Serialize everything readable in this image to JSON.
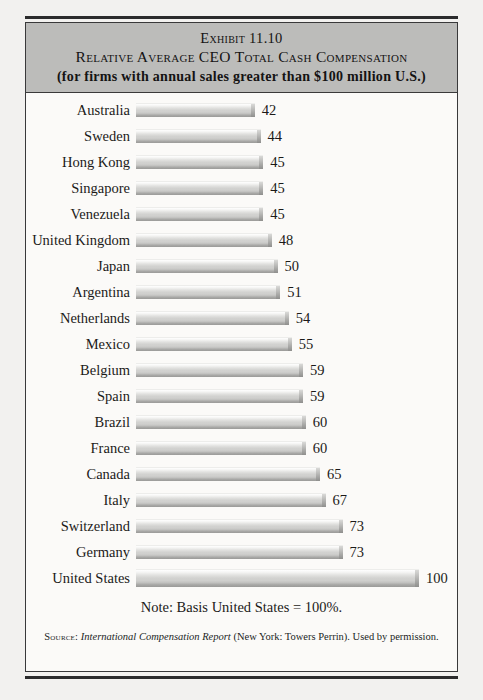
{
  "exhibit": {
    "number": "Exhibit 11.10",
    "title": "Relative Average CEO Total Cash Compensation",
    "subtitle": "(for firms with annual sales greater than $100 million U.S.)",
    "note": "Note: Basis United States = 100%.",
    "source_label": "Source:",
    "source_report": "International Compensation Report",
    "source_rest": "(New York: Towers Perrin). Used by permission."
  },
  "chart_data": {
    "type": "bar",
    "orientation": "horizontal",
    "title": "Relative Average CEO Total Cash Compensation",
    "subtitle": "(for firms with annual sales greater than $100 million U.S.)",
    "xlabel": "",
    "ylabel": "",
    "xlim": [
      0,
      100
    ],
    "grid": false,
    "legend": false,
    "value_unit": "index (United States = 100)",
    "categories": [
      "Australia",
      "Sweden",
      "Hong Kong",
      "Singapore",
      "Venezuela",
      "United Kingdom",
      "Japan",
      "Argentina",
      "Netherlands",
      "Mexico",
      "Belgium",
      "Spain",
      "Brazil",
      "France",
      "Canada",
      "Italy",
      "Switzerland",
      "Germany",
      "United States"
    ],
    "values": [
      42,
      44,
      45,
      45,
      45,
      48,
      50,
      51,
      54,
      55,
      59,
      59,
      60,
      60,
      65,
      67,
      73,
      73,
      100
    ],
    "bars": [
      {
        "label": "Australia",
        "value": 42,
        "value_text": "42"
      },
      {
        "label": "Sweden",
        "value": 44,
        "value_text": "44"
      },
      {
        "label": "Hong Kong",
        "value": 45,
        "value_text": "45"
      },
      {
        "label": "Singapore",
        "value": 45,
        "value_text": "45"
      },
      {
        "label": "Venezuela",
        "value": 45,
        "value_text": "45"
      },
      {
        "label": "United Kingdom",
        "value": 48,
        "value_text": "48"
      },
      {
        "label": "Japan",
        "value": 50,
        "value_text": "50"
      },
      {
        "label": "Argentina",
        "value": 51,
        "value_text": "51"
      },
      {
        "label": "Netherlands",
        "value": 54,
        "value_text": "54"
      },
      {
        "label": "Mexico",
        "value": 55,
        "value_text": "55"
      },
      {
        "label": "Belgium",
        "value": 59,
        "value_text": "59"
      },
      {
        "label": "Spain",
        "value": 59,
        "value_text": "59"
      },
      {
        "label": "Brazil",
        "value": 60,
        "value_text": "60"
      },
      {
        "label": "France",
        "value": 60,
        "value_text": "60"
      },
      {
        "label": "Canada",
        "value": 65,
        "value_text": "65"
      },
      {
        "label": "Italy",
        "value": 67,
        "value_text": "67"
      },
      {
        "label": "Switzerland",
        "value": 73,
        "value_text": "73"
      },
      {
        "label": "Germany",
        "value": 73,
        "value_text": "73"
      },
      {
        "label": "United States",
        "value": 100,
        "value_text": "100",
        "emphasis": true
      }
    ],
    "annotations": [
      "Note: Basis United States = 100%."
    ],
    "colors": {
      "band": "#bcbcba",
      "bar_light": "#ffffff",
      "bar_mid": "#d2d2d0",
      "bar_dark": "#9a9a98",
      "text": "#1b1a19",
      "paper": "#fbfaf8",
      "page": "#f2f1ef"
    }
  },
  "layout": {
    "row_height": 26,
    "first_row_top": 4,
    "bar_origin_x": 110,
    "bar_max_width": 283
  }
}
